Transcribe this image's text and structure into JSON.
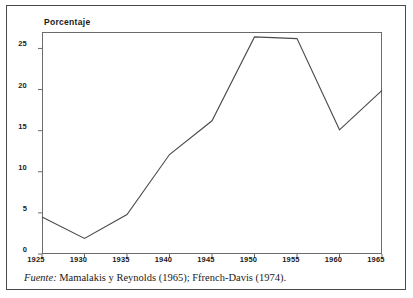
{
  "chart_data": {
    "type": "line",
    "title": "",
    "xlabel": "",
    "ylabel": "Porcentaje",
    "x": [
      1925,
      1930,
      1935,
      1940,
      1945,
      1950,
      1955,
      1960,
      1965
    ],
    "values": [
      4.5,
      1.9,
      4.8,
      12.1,
      16.2,
      26.4,
      26.2,
      15.1,
      19.9
    ],
    "series": [
      {
        "name": "Porcentaje",
        "values": [
          4.5,
          1.9,
          4.8,
          12.1,
          16.2,
          26.4,
          26.2,
          15.1,
          19.9
        ]
      }
    ],
    "xlim": [
      1925,
      1965
    ],
    "ylim": [
      0,
      27
    ],
    "xticks": [
      1925,
      1930,
      1935,
      1940,
      1945,
      1950,
      1955,
      1960,
      1965
    ],
    "xtick_labels": [
      "1925",
      "1930",
      "1935",
      "1940",
      "1945",
      "1950",
      "1955",
      "1960",
      "1965"
    ],
    "yticks": [
      0,
      5,
      10,
      15,
      20,
      25
    ],
    "ytick_labels": [
      "0",
      "5",
      "10",
      "15",
      "20",
      "25"
    ],
    "grid": false,
    "legend": false,
    "line_color": "#4a4a4a",
    "axis_color": "#6b6b6b",
    "frame_color": "#4a4a4a"
  },
  "caption": {
    "label": "Fuente:",
    "text": "Mamalakis y Reynolds (1965); Ffrench-Davis (1974)."
  }
}
